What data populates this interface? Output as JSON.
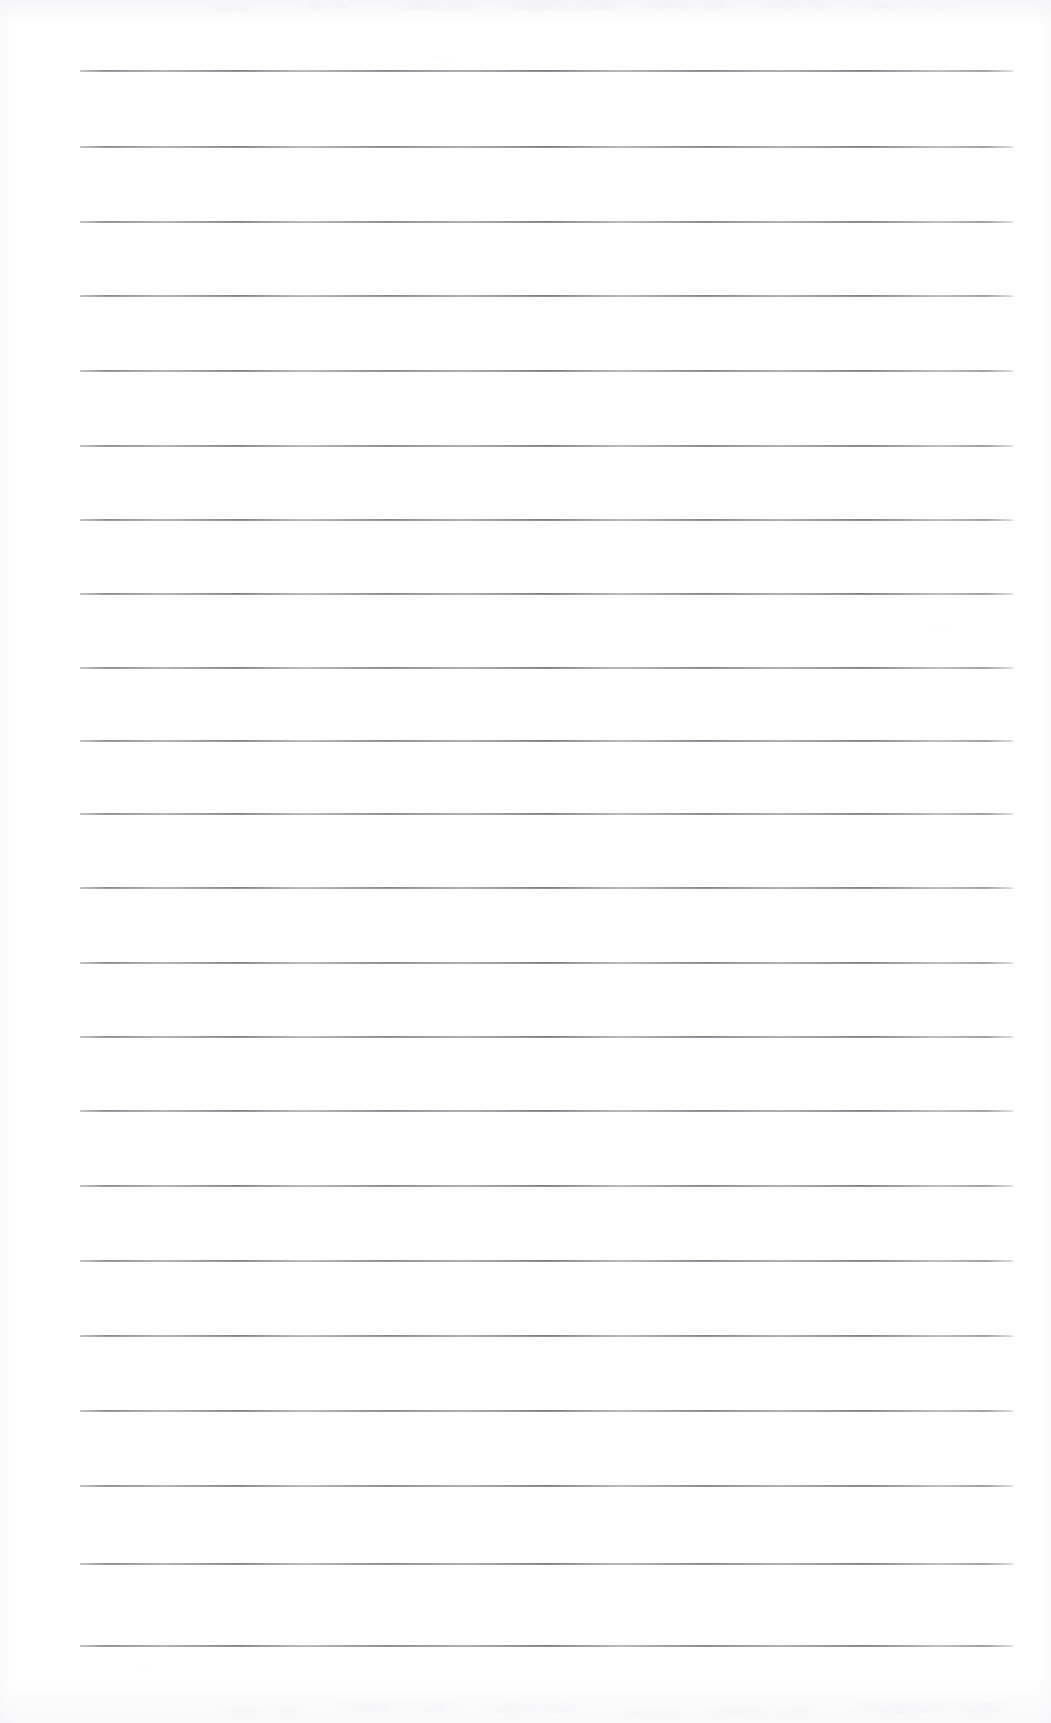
{
  "document": {
    "kind": "scanned-page",
    "title": "Blank ruled notebook page",
    "description": "Scanned sheet of blank lined writing paper with no handwriting or printed text",
    "text_content": "",
    "background_color": "#ffffff",
    "page_width": 1051,
    "page_height": 1723
  },
  "ruling": {
    "line_color": "#8a8c91",
    "line_color_light": "#b0b2b7",
    "line_thickness": 2,
    "line_count": 22,
    "line_left_x": 80,
    "line_right_x": 1013,
    "line_width": 933,
    "first_line_y": 70,
    "line_spacing": 74.5,
    "has_margin_rule": false,
    "style": "horizontal-ruled"
  },
  "lines": [
    {
      "index": 1,
      "y": 70,
      "content": ""
    },
    {
      "index": 2,
      "y": 146,
      "content": ""
    },
    {
      "index": 3,
      "y": 221,
      "content": ""
    },
    {
      "index": 4,
      "y": 295,
      "content": ""
    },
    {
      "index": 5,
      "y": 370,
      "content": ""
    },
    {
      "index": 6,
      "y": 445,
      "content": ""
    },
    {
      "index": 7,
      "y": 519,
      "content": ""
    },
    {
      "index": 8,
      "y": 593,
      "content": ""
    },
    {
      "index": 9,
      "y": 667,
      "content": ""
    },
    {
      "index": 10,
      "y": 740,
      "content": ""
    },
    {
      "index": 11,
      "y": 813,
      "content": ""
    },
    {
      "index": 12,
      "y": 887,
      "content": ""
    },
    {
      "index": 13,
      "y": 962,
      "content": ""
    },
    {
      "index": 14,
      "y": 1036,
      "content": ""
    },
    {
      "index": 15,
      "y": 1110,
      "content": ""
    },
    {
      "index": 16,
      "y": 1185,
      "content": ""
    },
    {
      "index": 17,
      "y": 1260,
      "content": ""
    },
    {
      "index": 18,
      "y": 1335,
      "content": ""
    },
    {
      "index": 19,
      "y": 1410,
      "content": ""
    },
    {
      "index": 20,
      "y": 1485,
      "content": ""
    },
    {
      "index": 21,
      "y": 1563,
      "content": ""
    },
    {
      "index": 22,
      "y": 1645,
      "content": ""
    }
  ],
  "speckles": [
    {
      "x": 212,
      "y": 6,
      "w": 38,
      "h": 5,
      "o": 0.3
    },
    {
      "x": 300,
      "y": 3,
      "w": 52,
      "h": 6,
      "o": 0.26
    },
    {
      "x": 395,
      "y": 2,
      "w": 80,
      "h": 8,
      "o": 0.32
    },
    {
      "x": 500,
      "y": 1,
      "w": 120,
      "h": 9,
      "o": 0.35
    },
    {
      "x": 640,
      "y": 2,
      "w": 95,
      "h": 7,
      "o": 0.3
    },
    {
      "x": 760,
      "y": 1,
      "w": 70,
      "h": 8,
      "o": 0.28
    },
    {
      "x": 850,
      "y": 3,
      "w": 110,
      "h": 6,
      "o": 0.26
    },
    {
      "x": 430,
      "y": 56,
      "w": 22,
      "h": 3,
      "o": 0.22
    },
    {
      "x": 933,
      "y": 628,
      "w": 14,
      "h": 3,
      "o": 0.2
    },
    {
      "x": 215,
      "y": 1706,
      "w": 90,
      "h": 8,
      "o": 0.24
    },
    {
      "x": 330,
      "y": 1702,
      "w": 130,
      "h": 10,
      "o": 0.26
    },
    {
      "x": 480,
      "y": 1704,
      "w": 100,
      "h": 9,
      "o": 0.24
    },
    {
      "x": 620,
      "y": 1708,
      "w": 60,
      "h": 7,
      "o": 0.22
    },
    {
      "x": 700,
      "y": 1706,
      "w": 120,
      "h": 9,
      "o": 0.24
    },
    {
      "x": 850,
      "y": 1702,
      "w": 160,
      "h": 11,
      "o": 0.28
    },
    {
      "x": 140,
      "y": 1669,
      "w": 10,
      "h": 4,
      "o": 0.18
    }
  ]
}
